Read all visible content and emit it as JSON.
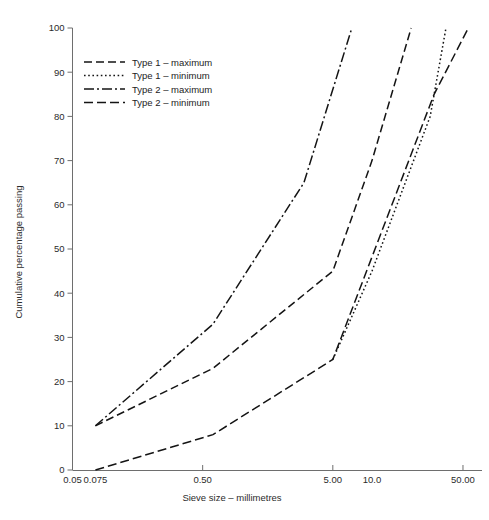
{
  "chart_data": {
    "type": "line",
    "title": "",
    "xlabel": "Sieve size – millimetres",
    "ylabel": "Cumulative percentage passing",
    "xscale": "log",
    "xlim": [
      0.05,
      70
    ],
    "ylim": [
      0,
      100
    ],
    "grid": false,
    "legend_position": "upper-left",
    "xticks": [
      {
        "value": 0.05,
        "label": "0.05",
        "has_mark": false
      },
      {
        "value": 0.075,
        "label": "0.075",
        "has_mark": false
      },
      {
        "value": 0.5,
        "label": "0.50",
        "has_mark": true
      },
      {
        "value": 5.0,
        "label": "5.00",
        "has_mark": true
      },
      {
        "value": 10.0,
        "label": "10.0",
        "has_mark": false
      },
      {
        "value": 50.0,
        "label": "50.00",
        "has_mark": true
      }
    ],
    "yticks": [
      {
        "value": 0,
        "label": "0"
      },
      {
        "value": 10,
        "label": "10"
      },
      {
        "value": 20,
        "label": "20"
      },
      {
        "value": 30,
        "label": "30"
      },
      {
        "value": 40,
        "label": "40"
      },
      {
        "value": 50,
        "label": "50"
      },
      {
        "value": 60,
        "label": "60"
      },
      {
        "value": 70,
        "label": "70"
      },
      {
        "value": 80,
        "label": "80"
      },
      {
        "value": 90,
        "label": "90"
      },
      {
        "value": 100,
        "label": "100"
      }
    ],
    "series": [
      {
        "name": "Type 1 – maximum",
        "dash": "dashed",
        "dasharray": "8,4",
        "points": [
          {
            "x": 0.075,
            "y": 10
          },
          {
            "x": 0.6,
            "y": 23
          },
          {
            "x": 5.0,
            "y": 45
          },
          {
            "x": 10.0,
            "y": 70
          },
          {
            "x": 20.0,
            "y": 100
          }
        ]
      },
      {
        "name": "Type 1 – minimum",
        "dash": "dotted",
        "dasharray": "1.6,2.6",
        "points": [
          {
            "x": 5.0,
            "y": 25
          },
          {
            "x": 10.0,
            "y": 45
          },
          {
            "x": 28.0,
            "y": 80
          },
          {
            "x": 37.0,
            "y": 100
          }
        ]
      },
      {
        "name": "Type 2 – maximum",
        "dash": "dash-dot",
        "dasharray": "10,3,2,3",
        "points": [
          {
            "x": 0.075,
            "y": 10
          },
          {
            "x": 0.6,
            "y": 33
          },
          {
            "x": 3.0,
            "y": 65
          },
          {
            "x": 7.0,
            "y": 100
          }
        ]
      },
      {
        "name": "Type 2 – minimum",
        "dash": "long-dash",
        "dasharray": "9,4",
        "points": [
          {
            "x": 0.075,
            "y": 0
          },
          {
            "x": 0.6,
            "y": 8
          },
          {
            "x": 5.0,
            "y": 25
          },
          {
            "x": 30.0,
            "y": 85
          },
          {
            "x": 55.0,
            "y": 100
          }
        ]
      }
    ]
  },
  "legend": {
    "entries": [
      {
        "label": "Type 1 – maximum",
        "dasharray": "8,4"
      },
      {
        "label": "Type 1 – minimum",
        "dasharray": "1.6,2.6"
      },
      {
        "label": "Type 2 – maximum",
        "dasharray": "10,3,2,3"
      },
      {
        "label": "Type 2 – minimum",
        "dasharray": "9,4"
      }
    ]
  },
  "colors": {
    "line": "#141414",
    "axis": "#6e6e6e",
    "text": "#2b2b2b",
    "background": "#ffffff"
  }
}
